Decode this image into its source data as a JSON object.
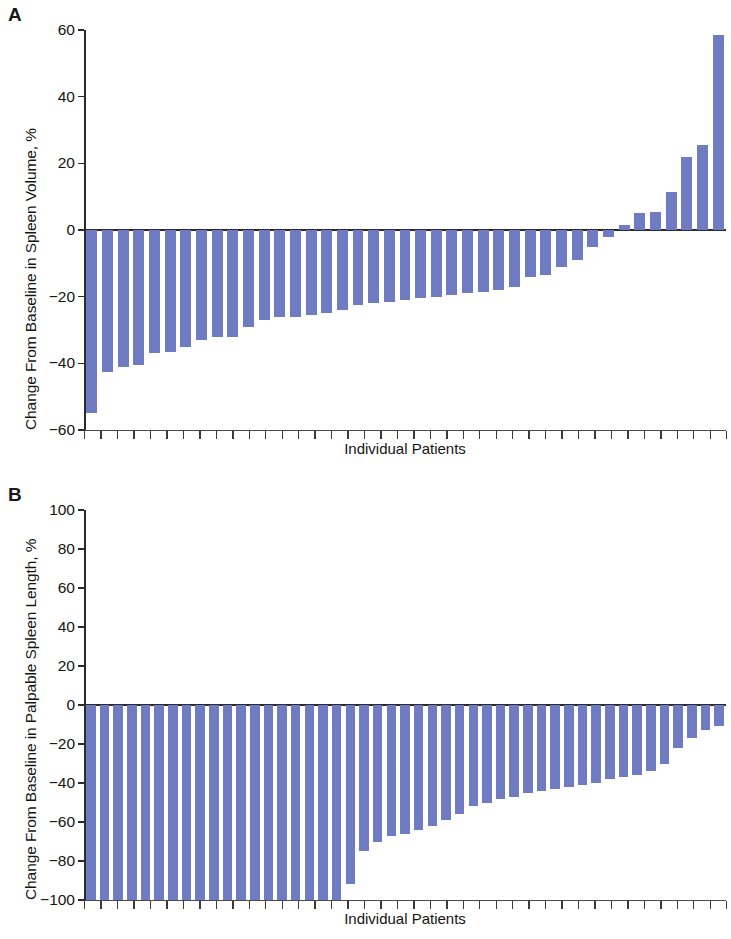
{
  "figure": {
    "panels": [
      {
        "id": "A",
        "letter": "A",
        "ylabel": "Change From Baseline in Spleen Volume, %",
        "xlabel": "Individual Patients"
      },
      {
        "id": "B",
        "letter": "B",
        "ylabel": "Change From Baseline in Palpable Spleen Length, %",
        "xlabel": "Individual Patients"
      }
    ],
    "bar_color": "#6a76c0",
    "axis_color": "#2b2b2b"
  },
  "chart_data": [
    {
      "type": "bar",
      "title": "A",
      "subtitle": "",
      "xlabel": "Individual Patients",
      "ylabel": "Change From Baseline in Spleen Volume, %",
      "ylim": [
        -60,
        60
      ],
      "yticks": [
        60,
        40,
        20,
        0,
        -20,
        -40,
        -60
      ],
      "ytick_labels": [
        "60",
        "40",
        "20",
        "0",
        "−20",
        "−40",
        "−60"
      ],
      "xticks_count": 39,
      "xtick_labels": [],
      "grid": false,
      "legend": false,
      "orientation": "waterfall-descending",
      "categories": [
        "P1",
        "P2",
        "P3",
        "P4",
        "P5",
        "P6",
        "P7",
        "P8",
        "P9",
        "P10",
        "P11",
        "P12",
        "P13",
        "P14",
        "P15",
        "P16",
        "P17",
        "P18",
        "P19",
        "P20",
        "P21",
        "P22",
        "P23",
        "P24",
        "P25",
        "P26",
        "P27",
        "P28",
        "P29",
        "P30",
        "P31",
        "P32",
        "P33",
        "P34",
        "P35",
        "P36",
        "P37",
        "P38",
        "P39"
      ],
      "values": [
        -55,
        -42.5,
        -41,
        -40.5,
        -37,
        -36.5,
        -35,
        -33,
        -32,
        -32,
        -29,
        -27,
        -26,
        -26,
        -25.5,
        -25,
        -24,
        -22.5,
        -22,
        -21.5,
        -21,
        -20.5,
        -20,
        -19.5,
        -19,
        -18.5,
        -18,
        -17,
        -14,
        -13.5,
        -11,
        -9,
        -5,
        -2,
        1.5,
        5,
        5.5,
        11.5,
        22,
        25.5,
        58.5
      ]
    },
    {
      "type": "bar",
      "title": "B",
      "subtitle": "",
      "xlabel": "Individual Patients",
      "ylabel": "Change From Baseline in Palpable Spleen Length, %",
      "ylim": [
        -100,
        100
      ],
      "yticks": [
        100,
        80,
        60,
        40,
        20,
        0,
        -20,
        -40,
        -60,
        -80,
        -100
      ],
      "ytick_labels": [
        "100",
        "80",
        "60",
        "40",
        "20",
        "0",
        "−20",
        "−40",
        "−60",
        "−80",
        "−100"
      ],
      "xticks_count": 39,
      "xtick_labels": [],
      "grid": false,
      "legend": false,
      "orientation": "waterfall-descending",
      "categories": [
        "P1",
        "P2",
        "P3",
        "P4",
        "P5",
        "P6",
        "P7",
        "P8",
        "P9",
        "P10",
        "P11",
        "P12",
        "P13",
        "P14",
        "P15",
        "P16",
        "P17",
        "P18",
        "P19",
        "P20",
        "P21",
        "P22",
        "P23",
        "P24",
        "P25",
        "P26",
        "P27",
        "P28",
        "P29",
        "P30",
        "P31",
        "P32",
        "P33",
        "P34",
        "P35",
        "P36",
        "P37",
        "P38",
        "P39"
      ],
      "values": [
        -100,
        -100,
        -100,
        -100,
        -100,
        -100,
        -100,
        -100,
        -100,
        -100,
        -100,
        -100,
        -100,
        -100,
        -100,
        -100,
        -100,
        -100,
        -100,
        -92,
        -75,
        -70,
        -67,
        -66,
        -64,
        -62,
        -59,
        -56,
        -52,
        -50,
        -48,
        -47,
        -45,
        -44,
        -43,
        -42,
        -41,
        -40,
        -38,
        -37,
        -36,
        -34,
        -30,
        -22,
        -17,
        -13,
        -11
      ]
    }
  ]
}
